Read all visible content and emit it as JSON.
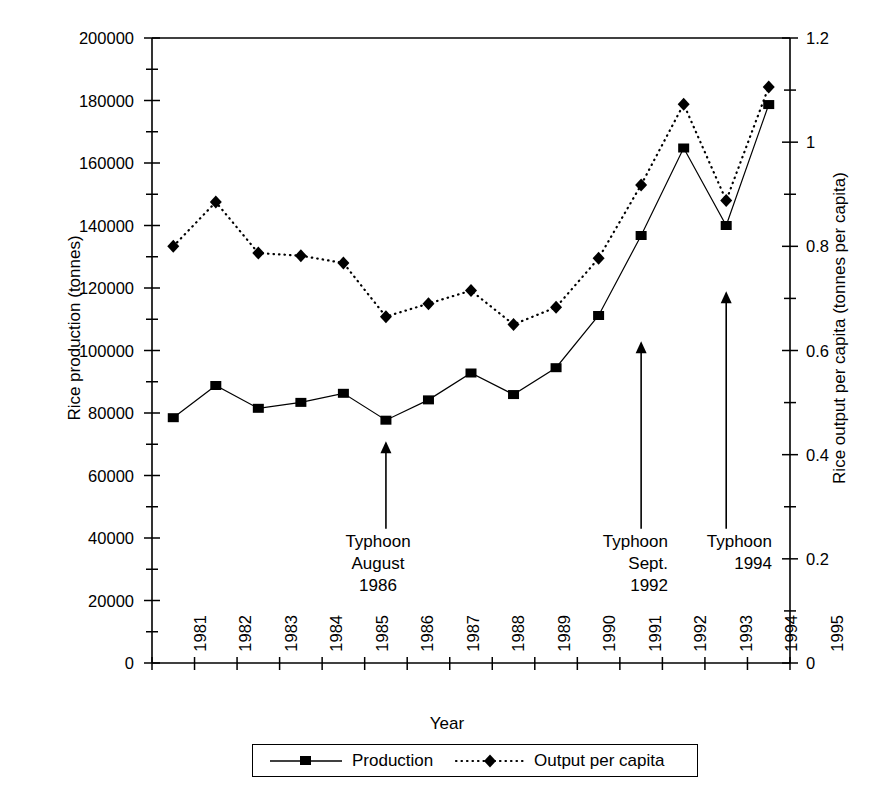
{
  "chart_data": {
    "type": "line",
    "title": "",
    "xlabel": "Year",
    "ylabel": "Rice production (tonnes)",
    "ylabel_right": "Rice output per capita (tonnes per capita)",
    "categories": [
      "1981",
      "1982",
      "1983",
      "1984",
      "1985",
      "1986",
      "1987",
      "1988",
      "1989",
      "1990",
      "1991",
      "1992",
      "1993",
      "1994",
      "1995"
    ],
    "x": [
      1981,
      1982,
      1983,
      1984,
      1985,
      1986,
      1987,
      1988,
      1989,
      1990,
      1991,
      1992,
      1993,
      1994,
      1995
    ],
    "ylim": [
      0,
      200000
    ],
    "ylim_right": [
      0,
      1.2
    ],
    "yticks": [
      "0",
      "20000",
      "40000",
      "60000",
      "80000",
      "100000",
      "120000",
      "140000",
      "160000",
      "180000",
      "200000"
    ],
    "yticks_right": [
      "0",
      "0.2",
      "0.4",
      "0.6",
      "0.8",
      "1",
      "1.2"
    ],
    "grid": false,
    "legend_position": "bottom",
    "series": [
      {
        "name": "Production",
        "axis": "left",
        "marker": "square",
        "linestyle": "solid",
        "values": [
          78500,
          88800,
          81500,
          83400,
          86300,
          77700,
          84200,
          92800,
          85900,
          94500,
          111200,
          136800,
          164800,
          140000,
          178700
        ]
      },
      {
        "name": "Output per capita",
        "axis": "right",
        "marker": "diamond",
        "linestyle": "dotted",
        "values": [
          0.8,
          0.885,
          0.787,
          0.782,
          0.768,
          0.665,
          0.69,
          0.715,
          0.65,
          0.683,
          0.777,
          0.918,
          1.073,
          0.888,
          1.106
        ]
      }
    ],
    "annotations": [
      {
        "id": "typhoon-1986",
        "lines": [
          "Typhoon",
          "August",
          "1986"
        ],
        "align": "center",
        "arrow_x_year": 1986,
        "arrow_tip_value": 71000,
        "arrow_tail_value": 43000
      },
      {
        "id": "typhoon-1992",
        "lines": [
          "Typhoon",
          "Sept.",
          "1992"
        ],
        "align": "right",
        "arrow_x_year": 1992,
        "arrow_tip_value": 103000,
        "arrow_tail_value": 43000
      },
      {
        "id": "typhoon-1994",
        "lines": [
          "Typhoon",
          "1994"
        ],
        "align": "right",
        "arrow_x_year": 1994,
        "arrow_tip_value": 119000,
        "arrow_tail_value": 43000
      }
    ]
  },
  "legend": {
    "entries": [
      {
        "label": "Production"
      },
      {
        "label": "Output per capita"
      }
    ]
  },
  "axes": {
    "y_left_title": "Rice production (tonnes)",
    "y_right_title": "Rice output per capita (tonnes per capita)",
    "x_title": "Year",
    "y_left_ticks": [
      "200000",
      "180000",
      "160000",
      "140000",
      "120000",
      "100000",
      "80000",
      "60000",
      "40000",
      "20000",
      "0"
    ],
    "y_right_ticks": [
      "1.2",
      "1",
      "0.8",
      "0.6",
      "0.4",
      "0.2",
      "0"
    ],
    "x_ticks": [
      "1981",
      "1982",
      "1983",
      "1984",
      "1985",
      "1986",
      "1987",
      "1988",
      "1989",
      "1990",
      "1991",
      "1992",
      "1993",
      "1994",
      "1995"
    ]
  },
  "annotations": {
    "a1": {
      "l1": "Typhoon",
      "l2": "August",
      "l3": "1986"
    },
    "a2": {
      "l1": "Typhoon",
      "l2": "Sept.",
      "l3": "1992"
    },
    "a3": {
      "l1": "Typhoon",
      "l2": "1994"
    }
  }
}
